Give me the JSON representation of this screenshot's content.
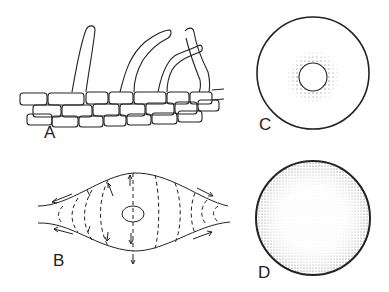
{
  "figure": {
    "panels": [
      {
        "id": "A",
        "label": "A",
        "description": "Hyphae growing upward from a layer of elongated cells"
      },
      {
        "id": "B",
        "label": "B",
        "description": "Spindle-shaped body with dashed flow lines and directional arrows around a central nucleus"
      },
      {
        "id": "C",
        "label": "C",
        "description": "Circle with stippled ring surrounding a small central circle"
      },
      {
        "id": "D",
        "label": "D",
        "description": "Circle with dense stippling concentrated near the periphery"
      }
    ]
  },
  "colors": {
    "ink": "#222222",
    "background": "#ffffff"
  }
}
